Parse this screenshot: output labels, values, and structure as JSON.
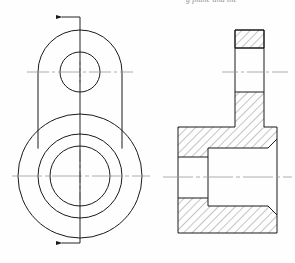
{
  "page": {
    "background_color": "#fefefe",
    "width": 295,
    "height": 263
  },
  "caption": {
    "clipped_text": "g plane and the"
  },
  "styles": {
    "outline_color": "#1a1a1a",
    "hatch_color": "#2a2a2a",
    "centerline_color": "#9a9a9a",
    "cutting_plane_color": "#1a1a1a",
    "outline_width": "1.0",
    "thin_width": "0.7",
    "hatch_width": "0.55"
  },
  "views": {
    "left_view": {
      "name": "front-view",
      "label": "Front view with cutting plane",
      "small_boss": {
        "center_x": 80,
        "center_y": 72,
        "outer_radius": 42,
        "hole_radius": 20
      },
      "large_boss": {
        "center_x": 80,
        "center_y": 176,
        "outer_radius": 62,
        "middle_radius": 42,
        "bore_radius": 30
      },
      "tangent_left_x": 38,
      "tangent_right_x": 122,
      "horizontal_centerlines": [
        {
          "y": 72,
          "x1": 27,
          "x2": 133
        },
        {
          "y": 176,
          "x1": 12,
          "x2": 150
        }
      ],
      "cutting_plane": {
        "x": 80,
        "y_top": 17,
        "y_bottom": 243,
        "arrow_direction": "left",
        "arrow_length": 19,
        "arrow_top_y": 17,
        "arrow_bottom_y": 243
      }
    },
    "right_view": {
      "name": "section-view",
      "label": "Full section view A-A",
      "body_left_x": 178,
      "body_right_x": 277,
      "body_top_y": 127,
      "body_bottom_y": 233,
      "boss_left_x": 235,
      "boss_right_x": 264,
      "boss_top_y": 30,
      "boss_collar_y": 48,
      "boss_bottom_y": 92,
      "bore_top_y": 148,
      "bore_bottom_y": 206,
      "bore_left_x": 208,
      "counterbore_left_x": 178,
      "counterbore_top_y": 157,
      "counterbore_bottom_y": 198,
      "chamfer": 9,
      "horizontal_centerlines": [
        {
          "y": 72,
          "x1": 222,
          "x2": 288
        },
        {
          "y": 177,
          "x1": 163,
          "x2": 292
        }
      ]
    }
  },
  "hatch": {
    "pattern_angle_deg": 45,
    "spacing": 6,
    "regions": [
      "upper-boss-top",
      "upper-boss-lower",
      "flange-upper-left",
      "flange-upper-right",
      "flange-lower-left",
      "flange-lower-right"
    ]
  }
}
